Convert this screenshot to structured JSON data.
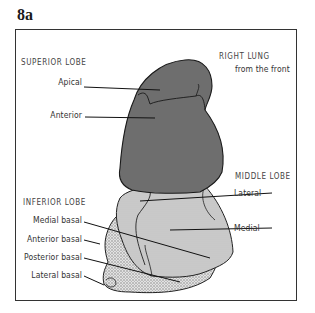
{
  "figure": {
    "number": "8a",
    "title": "RIGHT LUNG",
    "subtitle": "from the front"
  },
  "lobes": {
    "superior": {
      "heading": "SUPERIOR LOBE",
      "segments": [
        "Apical",
        "Anterior"
      ],
      "fill": "#6e6e6e"
    },
    "middle": {
      "heading": "MIDDLE LOBE",
      "segments": [
        "Lateral",
        "Medial"
      ],
      "fill": "#c8c8c8"
    },
    "inferior": {
      "heading": "INFERIOR LOBE",
      "segments": [
        "Medial basal",
        "Anterior basal",
        "Posterior basal",
        "Lateral basal"
      ],
      "fill": "#d9d9d9"
    }
  }
}
